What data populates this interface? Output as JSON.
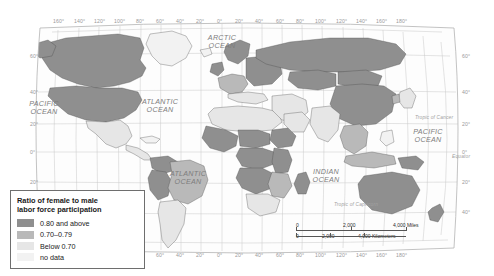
{
  "figure": {
    "kind": "choropleth-world-map",
    "projection": "robinson"
  },
  "legend": {
    "title": "Ratio of female to male labor force participation",
    "title_line1": "Ratio of female to male",
    "title_line2": "labor force participation",
    "items": [
      {
        "swatch": "sw-high",
        "label": "0.80 and above",
        "color": "#8f8f8f"
      },
      {
        "swatch": "sw-mid",
        "label": "0.70–0.79",
        "color": "#b9b9b9"
      },
      {
        "swatch": "sw-low",
        "label": "Below 0.70",
        "color": "#e6e6e6"
      },
      {
        "swatch": "sw-nod",
        "label": "no data",
        "color": "#f2f2f2"
      }
    ]
  },
  "scalebar": {
    "miles": {
      "zero": "0",
      "mid": "2,000",
      "end": "4,000 Miles"
    },
    "kilometers": {
      "zero": "0",
      "mid": "2,000",
      "end": "4,000 Kilometers"
    }
  },
  "ocean_labels": [
    {
      "id": "arctic",
      "line1": "ARCTIC",
      "line2": "OCEAN",
      "x": 222,
      "y": 34
    },
    {
      "id": "pacific-west",
      "line1": "PACIFIC",
      "line2": "OCEAN",
      "x": 44,
      "y": 100
    },
    {
      "id": "atlantic-north",
      "line1": "ATLANTIC",
      "line2": "OCEAN",
      "x": 160,
      "y": 98
    },
    {
      "id": "atlantic-south",
      "line1": "ATLANTIC",
      "line2": "OCEAN",
      "x": 188,
      "y": 170
    },
    {
      "id": "indian",
      "line1": "INDIAN",
      "line2": "OCEAN",
      "x": 326,
      "y": 168
    },
    {
      "id": "pacific-east",
      "line1": "PACIFIC",
      "line2": "OCEAN",
      "x": 428,
      "y": 128
    }
  ],
  "reference_lines": [
    {
      "id": "tropic-of-cancer",
      "label": "Tropic of Cancer",
      "x": 415,
      "y": 115
    },
    {
      "id": "equator",
      "label": "Equator",
      "x": 452,
      "y": 154
    },
    {
      "id": "tropic-of-capricorn",
      "label": "Tropic of Capricorn",
      "x": 334,
      "y": 202
    }
  ],
  "axes": {
    "longitude_top": [
      {
        "label": "160°",
        "x": 58
      },
      {
        "label": "140°",
        "x": 79
      },
      {
        "label": "120°",
        "x": 99
      },
      {
        "label": "100°",
        "x": 119
      },
      {
        "label": "80°",
        "x": 141
      },
      {
        "label": "60°",
        "x": 161
      },
      {
        "label": "40°",
        "x": 181
      },
      {
        "label": "20°",
        "x": 201
      },
      {
        "label": "0°",
        "x": 222
      },
      {
        "label": "20°",
        "x": 240
      },
      {
        "label": "40°",
        "x": 260
      },
      {
        "label": "60°",
        "x": 281
      },
      {
        "label": "80°",
        "x": 301
      },
      {
        "label": "100°",
        "x": 320
      },
      {
        "label": "120°",
        "x": 341
      },
      {
        "label": "140°",
        "x": 361
      },
      {
        "label": "160°",
        "x": 381
      },
      {
        "label": "180°",
        "x": 401
      }
    ],
    "longitude_bottom": [
      {
        "label": "80°",
        "x": 141
      },
      {
        "label": "60°",
        "x": 161
      },
      {
        "label": "40°",
        "x": 181
      },
      {
        "label": "20°",
        "x": 201
      },
      {
        "label": "0°",
        "x": 222
      },
      {
        "label": "20°",
        "x": 240
      },
      {
        "label": "40°",
        "x": 260
      },
      {
        "label": "60°",
        "x": 281
      },
      {
        "label": "80°",
        "x": 301
      },
      {
        "label": "100°",
        "x": 320
      },
      {
        "label": "120°",
        "x": 341
      },
      {
        "label": "140°",
        "x": 361
      },
      {
        "label": "160°",
        "x": 381
      },
      {
        "label": "180°",
        "x": 401
      }
    ],
    "latitude_left": [
      {
        "label": "60°",
        "y": 56
      },
      {
        "label": "40°",
        "y": 92
      },
      {
        "label": "20°",
        "y": 124
      },
      {
        "label": "0°",
        "y": 152
      },
      {
        "label": "20°",
        "y": 182
      },
      {
        "label": "40°",
        "y": 212
      }
    ],
    "latitude_right": [
      {
        "label": "60°",
        "y": 56
      },
      {
        "label": "40°",
        "y": 92
      },
      {
        "label": "20°",
        "y": 124
      },
      {
        "label": "0°",
        "y": 152
      },
      {
        "label": "20°",
        "y": 182
      },
      {
        "label": "40°",
        "y": 212
      }
    ]
  },
  "chart_data": {
    "type": "heatmap",
    "title": "Ratio of female to male labor force participation",
    "legend_position": "bottom-left",
    "grid": true,
    "categories": [
      "0.80 and above",
      "0.70-0.79",
      "Below 0.70",
      "no data"
    ],
    "values": [
      null,
      null,
      null,
      null
    ],
    "xlabel": "",
    "ylabel": "",
    "regions": [
      {
        "name": "Canada",
        "class": "0.80 and above"
      },
      {
        "name": "United States",
        "class": "0.80 and above"
      },
      {
        "name": "Mexico",
        "class": "Below 0.70"
      },
      {
        "name": "Brazil",
        "class": "0.70-0.79"
      },
      {
        "name": "Argentina",
        "class": "Below 0.70"
      },
      {
        "name": "Peru",
        "class": "0.80 and above"
      },
      {
        "name": "Bolivia",
        "class": "0.80 and above"
      },
      {
        "name": "Greenland",
        "class": "no data"
      },
      {
        "name": "Russia",
        "class": "0.80 and above"
      },
      {
        "name": "China",
        "class": "0.80 and above"
      },
      {
        "name": "Mongolia",
        "class": "0.80 and above"
      },
      {
        "name": "India",
        "class": "Below 0.70"
      },
      {
        "name": "Sweden",
        "class": "0.80 and above"
      },
      {
        "name": "Norway",
        "class": "0.80 and above"
      },
      {
        "name": "Finland",
        "class": "0.80 and above"
      },
      {
        "name": "Northern Africa",
        "class": "Below 0.70"
      },
      {
        "name": "Sub-Saharan Africa",
        "class": "0.80 and above"
      },
      {
        "name": "Middle East",
        "class": "Below 0.70"
      },
      {
        "name": "Australia",
        "class": "0.80 and above"
      },
      {
        "name": "New Zealand",
        "class": "0.80 and above"
      },
      {
        "name": "Southeast Asia",
        "class": "0.70-0.79"
      }
    ]
  }
}
